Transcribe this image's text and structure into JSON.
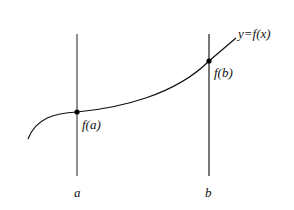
{
  "diagram": {
    "curve_label": "y=f(x)",
    "point_a_label": "f(a)",
    "point_b_label": "f(b)",
    "axis_a_label": "a",
    "axis_b_label": "b",
    "colors": {
      "line": "#555555",
      "curve": "#111111",
      "point": "#000000"
    }
  }
}
